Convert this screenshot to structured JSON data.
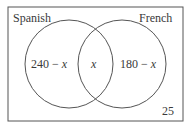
{
  "diagram": {
    "type": "venn",
    "sets": [
      {
        "label": "Spanish",
        "region_only": "240 − ",
        "region_var": "x"
      },
      {
        "label": "French",
        "region_only": "180 − ",
        "region_var": "x"
      }
    ],
    "intersection": "x",
    "outside": "25",
    "colors": {
      "stroke": "#555555",
      "text": "#3a3a3a",
      "background": "#ffffff"
    }
  }
}
